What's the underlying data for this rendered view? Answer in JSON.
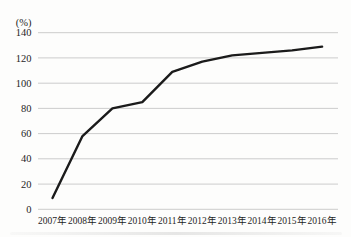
{
  "chart_data": {
    "type": "line",
    "title": "",
    "unit_label": "(%)",
    "categories": [
      "2007年",
      "2008年",
      "2009年",
      "2010年",
      "2011年",
      "2012年",
      "2013年",
      "2014年",
      "2015年",
      "2016年"
    ],
    "values": [
      9,
      58,
      80,
      85,
      109,
      117,
      122,
      124,
      126,
      129
    ],
    "xlabel": "",
    "ylabel": "(%)",
    "ylim": [
      0,
      140
    ],
    "yticks": [
      0,
      20,
      40,
      60,
      80,
      100,
      120,
      140
    ],
    "grid": true,
    "legend_position": "none",
    "line_color": "#1b1b1b",
    "grid_color": "#c6c6c6",
    "text_color": "#1f1f1f",
    "background_color": "#fdfdfc"
  }
}
